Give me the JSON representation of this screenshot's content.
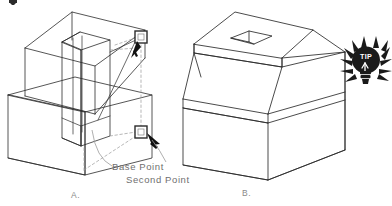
{
  "figure": {
    "caption_a": "A.",
    "caption_b": "B.",
    "annotations": {
      "base_point": "Base  Point",
      "second_point": "Second  Point"
    },
    "tip_badge": {
      "text": "TIP",
      "icon": "lightbulb-icon"
    },
    "colors": {
      "line": "#2b2b2b",
      "construction": "#9a9a9a",
      "label_text": "#6f6f6f",
      "caption_text": "#8a8a8a",
      "marker_fill": "#ffffff",
      "cursor_fill": "#111111",
      "tip_fill": "#1a1a1a",
      "background": "#ffffff"
    }
  }
}
